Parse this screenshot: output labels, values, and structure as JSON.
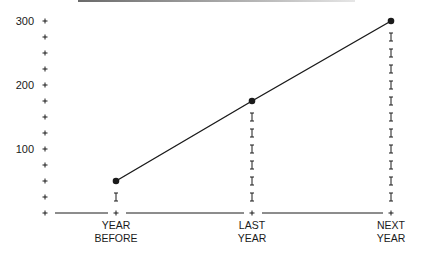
{
  "chart_data": {
    "type": "line",
    "title": "",
    "xlabel": "",
    "ylabel": "",
    "categories": [
      "YEAR BEFORE",
      "LAST YEAR",
      "NEXT YEAR"
    ],
    "category_lines": [
      [
        "YEAR",
        "BEFORE"
      ],
      [
        "LAST",
        "YEAR"
      ],
      [
        "NEXT",
        "YEAR"
      ]
    ],
    "values": [
      50,
      175,
      300
    ],
    "ylim": [
      0,
      300
    ],
    "y_tick_step": 25,
    "y_tick_labels": [
      "100",
      "200",
      "300"
    ],
    "y_tick_label_values": [
      100,
      200,
      300
    ],
    "grid": false,
    "legend": null,
    "markers": "filled-circle",
    "drop_lines": "dotted I-bar markers from point to baseline"
  },
  "colors": {
    "line": "#1a1a1a",
    "text": "#1a1a1a",
    "top_rule": "#8a8a8a"
  }
}
